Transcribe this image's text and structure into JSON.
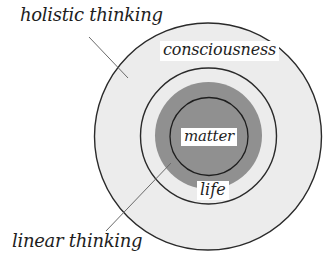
{
  "diagram": {
    "type": "concentric-circles",
    "colors": {
      "background": "#ffffff",
      "outer_fill": "#ececec",
      "middle_fill": "#ececec",
      "core_fill": "#909090",
      "stroke": "#2a2a2a",
      "leader_line": "#6a6a6a",
      "label_bg": "#ffffff",
      "text": "#1e1e1e"
    },
    "rings": [
      {
        "name": "consciousness",
        "label": "consciousness"
      },
      {
        "name": "life",
        "label": "life"
      },
      {
        "name": "matter",
        "label": "matter"
      }
    ],
    "annotations": {
      "holistic": "holistic thinking",
      "linear": "linear thinking"
    }
  }
}
